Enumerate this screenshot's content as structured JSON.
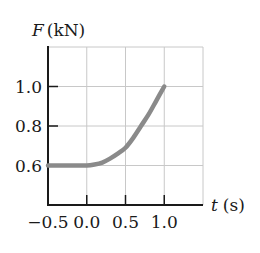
{
  "chart_data": {
    "type": "line",
    "title": "",
    "ylabel": "F (kN)",
    "ylabel_var": "F",
    "ylabel_unit": "(kN)",
    "xlabel": "t (s)",
    "xlabel_var": "t",
    "xlabel_unit": "(s)",
    "xlim": [
      -0.5,
      1.5
    ],
    "ylim": [
      0.4,
      1.2
    ],
    "xticks": [
      -0.5,
      0.0,
      0.5,
      1.0
    ],
    "xtick_labels": [
      "−0.5",
      "0.0",
      "0.5",
      "1.0"
    ],
    "yticks": [
      0.6,
      0.8,
      1.0
    ],
    "ytick_labels": [
      "0.6",
      "0.8",
      "1.0"
    ],
    "grid": true,
    "legend": null,
    "series": [
      {
        "name": "F(t)",
        "color": "#8a8a8a",
        "x": [
          -0.5,
          -0.25,
          0.0,
          0.1,
          0.2,
          0.3,
          0.4,
          0.5,
          0.6,
          0.7,
          0.8,
          0.9,
          1.0
        ],
        "y": [
          0.6,
          0.6,
          0.6,
          0.605,
          0.615,
          0.635,
          0.66,
          0.69,
          0.74,
          0.8,
          0.86,
          0.93,
          1.0
        ]
      }
    ]
  },
  "colors": {
    "axis": "#1a1a1a",
    "grid": "#c8c8c8",
    "curve": "#8a8a8a"
  }
}
